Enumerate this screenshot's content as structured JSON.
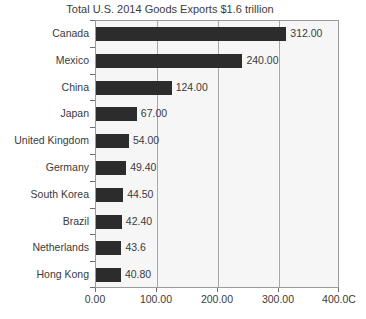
{
  "chart_data": {
    "type": "bar",
    "orientation": "horizontal",
    "title": "Total U.S. 2014 Goods Exports $1.6 trillion",
    "xlabel": "",
    "ylabel": "",
    "xlim": [
      0,
      400
    ],
    "grid": true,
    "legend": false,
    "categories": [
      "Canada",
      "Mexico",
      "China",
      "Japan",
      "United Kingdom",
      "Germany",
      "South Korea",
      "Brazil",
      "Netherlands",
      "Hong Kong"
    ],
    "values": [
      312.0,
      240.0,
      124.0,
      67.0,
      54.0,
      49.4,
      44.5,
      42.4,
      43.6,
      40.8
    ],
    "value_labels": [
      "312.00",
      "240.00",
      "124.00",
      "67.00",
      "54.00",
      "49.40",
      "44.50",
      "42.40",
      "43.6",
      "40.80"
    ],
    "bar_lengths": [
      312.0,
      240.0,
      124.0,
      67.0,
      54.0,
      49.4,
      44.5,
      42.4,
      41.6,
      40.8
    ],
    "xticks": [
      0,
      100,
      200,
      300,
      400
    ],
    "xtick_labels": [
      "0.00",
      "100.00",
      "200.00",
      "300.00",
      "400.00"
    ],
    "xtick_labels_rendered": [
      "0.00",
      "100.00",
      "200.00",
      "300.00",
      "400.0C"
    ],
    "colors": {
      "bar": "#2c2c2c",
      "plot_background": "#f6f6f6",
      "page_background": "#ffffff",
      "gridline": "#a8a8a8",
      "axis": "#9a9a9a",
      "text": "#3a3a3a"
    }
  }
}
